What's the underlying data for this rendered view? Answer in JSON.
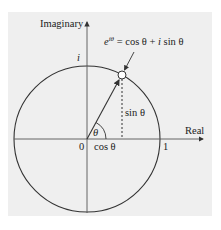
{
  "diagram": {
    "axes": {
      "vertical_label": "Imaginary",
      "horizontal_label": "Real"
    },
    "labels": {
      "i_label": "i",
      "origin_label": "0",
      "one_label": "1",
      "formula_e": "e",
      "formula_exp": "iθ",
      "formula_rest": " = cos θ + ",
      "formula_i": "i",
      "formula_sin": " sin θ",
      "sin_label": "sin θ",
      "cos_label": "cos θ",
      "theta_label": "θ"
    },
    "colors": {
      "panel_bg": "#efefef",
      "line": "#333333",
      "page_bg": "#ffffff"
    },
    "geometry": {
      "center": [
        87,
        139
      ],
      "radius": 73,
      "point": [
        122,
        75
      ]
    }
  }
}
